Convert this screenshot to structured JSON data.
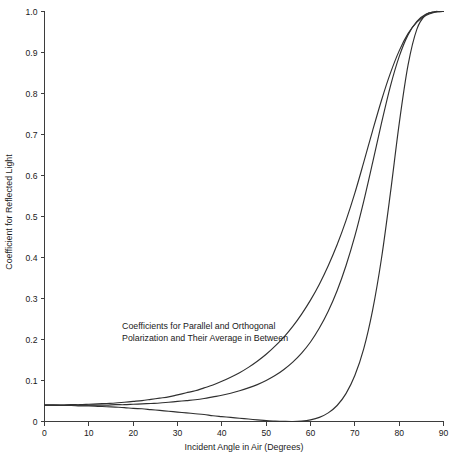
{
  "chart_data": {
    "type": "line",
    "title": "",
    "xlabel": "Incident Angle in Air (Degrees)",
    "ylabel": "Coefficient for Reflected Light",
    "xlim": [
      0,
      90
    ],
    "ylim": [
      0,
      1.0
    ],
    "grid": false,
    "legend_position": "none",
    "xticks": [
      0,
      10,
      20,
      30,
      40,
      50,
      60,
      70,
      80,
      90
    ],
    "xtick_labels": [
      "0",
      "10",
      "20",
      "30",
      "40",
      "50",
      "60",
      "70",
      "80",
      "90"
    ],
    "yticks": [
      0,
      0.1,
      0.2,
      0.3,
      0.4,
      0.5,
      0.6,
      0.7,
      0.8,
      0.9,
      1.0
    ],
    "ytick_labels": [
      "0",
      "0.1",
      "0.2",
      "0.3",
      "0.4",
      "0.5",
      "0.6",
      "0.7",
      "0.8",
      "0.9",
      "1.0"
    ],
    "annotations": [
      {
        "name": "curve-description",
        "line1": "Coefficients for Parallel and Orthogonal",
        "line2": "Polarization and Their Average in Between",
        "x": 17.5,
        "y": 0.225
      }
    ],
    "x": [
      0,
      2,
      4,
      6,
      8,
      10,
      12,
      14,
      16,
      18,
      20,
      22,
      24,
      26,
      28,
      30,
      32,
      34,
      36,
      38,
      40,
      42,
      44,
      46,
      48,
      50,
      52,
      54,
      56,
      58,
      60,
      62,
      64,
      66,
      68,
      70,
      72,
      74,
      76,
      78,
      80,
      82,
      84,
      86,
      88,
      89,
      90
    ],
    "series": [
      {
        "name": "Orthogonal Polarization (s-polarized)",
        "color": "#303030",
        "values": [
          0.04,
          0.04,
          0.04,
          0.041,
          0.041,
          0.042,
          0.043,
          0.044,
          0.045,
          0.047,
          0.049,
          0.051,
          0.054,
          0.057,
          0.06,
          0.065,
          0.07,
          0.075,
          0.082,
          0.089,
          0.098,
          0.108,
          0.119,
          0.132,
          0.147,
          0.164,
          0.184,
          0.206,
          0.232,
          0.262,
          0.296,
          0.335,
          0.38,
          0.431,
          0.49,
          0.557,
          0.632,
          0.709,
          0.783,
          0.849,
          0.904,
          0.946,
          0.974,
          0.99,
          0.998,
          0.9995,
          1.0
        ]
      },
      {
        "name": "Average of Both Polarizations",
        "color": "#303030",
        "values": [
          0.04,
          0.04,
          0.04,
          0.04,
          0.04,
          0.04,
          0.04,
          0.04,
          0.041,
          0.041,
          0.042,
          0.043,
          0.044,
          0.045,
          0.047,
          0.049,
          0.051,
          0.053,
          0.056,
          0.06,
          0.064,
          0.069,
          0.075,
          0.082,
          0.09,
          0.1,
          0.112,
          0.127,
          0.145,
          0.167,
          0.194,
          0.228,
          0.269,
          0.319,
          0.38,
          0.452,
          0.537,
          0.631,
          0.727,
          0.817,
          0.89,
          0.943,
          0.976,
          0.993,
          0.999,
          0.9997,
          1.0
        ]
      },
      {
        "name": "Parallel Polarization (p-polarized)",
        "color": "#303030",
        "values": [
          0.04,
          0.04,
          0.039,
          0.039,
          0.038,
          0.038,
          0.037,
          0.036,
          0.035,
          0.034,
          0.032,
          0.031,
          0.029,
          0.027,
          0.025,
          0.023,
          0.021,
          0.019,
          0.017,
          0.014,
          0.012,
          0.01,
          0.008,
          0.006,
          0.004,
          0.002,
          0.001,
          0.0003,
          0.0,
          0.001,
          0.004,
          0.01,
          0.021,
          0.039,
          0.068,
          0.112,
          0.177,
          0.271,
          0.397,
          0.555,
          0.726,
          0.869,
          0.957,
          0.992,
          0.9995,
          0.99993,
          1.0
        ]
      }
    ]
  }
}
